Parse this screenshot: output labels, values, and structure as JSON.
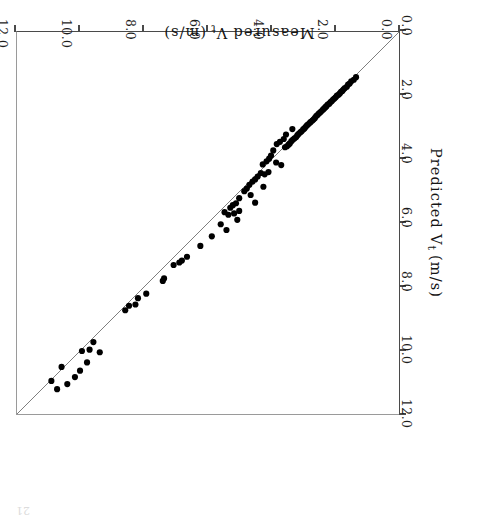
{
  "figure": {
    "rotation_degrees": 180,
    "background_color": "#ffffff",
    "frame_color": "#4a4a4a",
    "point_color": "#000000",
    "reference_line_color": "#707070",
    "page_artifact": "21"
  },
  "chart_data": {
    "type": "scatter",
    "title": "",
    "xlabel_parts": {
      "pre": "Measured",
      "symbol": "V",
      "subscript": "t",
      "units": "(m/s)"
    },
    "ylabel_parts": {
      "pre": "Predicted",
      "symbol": "V",
      "subscript": "t",
      "units": "(m/s)"
    },
    "xlabel": "Measured Vt (m/s)",
    "ylabel": "Predicted Vt (m/s)",
    "xlim": [
      0.0,
      12.0
    ],
    "ylim": [
      0.0,
      12.0
    ],
    "xticks": [
      0.0,
      2.0,
      4.0,
      6.0,
      8.0,
      10.0,
      12.0
    ],
    "yticks": [
      0.0,
      2.0,
      4.0,
      6.0,
      8.0,
      10.0,
      12.0
    ],
    "xticklabels": [
      "0.0",
      "2.0",
      "4.0",
      "6.0",
      "8.0",
      "10.0",
      "12.0"
    ],
    "yticklabels": [
      "0.0",
      "2.0",
      "4.0",
      "6.0",
      "8.0",
      "10.0",
      "12.0"
    ],
    "grid": false,
    "legend": null,
    "legend_position": "none",
    "marker": "filled-circle",
    "marker_size_px": 6.2,
    "reference_line": {
      "label": "1:1 line",
      "x": [
        0.0,
        12.0
      ],
      "y": [
        0.0,
        12.0
      ],
      "style": "solid",
      "width_px": 0.9
    },
    "points": [
      [
        1.35,
        1.42
      ],
      [
        1.42,
        1.5
      ],
      [
        1.5,
        1.55
      ],
      [
        1.55,
        1.62
      ],
      [
        1.6,
        1.65
      ],
      [
        1.64,
        1.72
      ],
      [
        1.7,
        1.76
      ],
      [
        1.74,
        1.8
      ],
      [
        1.78,
        1.85
      ],
      [
        1.82,
        1.88
      ],
      [
        1.86,
        1.93
      ],
      [
        1.9,
        1.97
      ],
      [
        1.95,
        2.0
      ],
      [
        1.99,
        2.05
      ],
      [
        2.03,
        2.09
      ],
      [
        2.07,
        2.12
      ],
      [
        2.11,
        2.17
      ],
      [
        2.15,
        2.2
      ],
      [
        2.19,
        2.25
      ],
      [
        2.24,
        2.28
      ],
      [
        2.28,
        2.33
      ],
      [
        2.31,
        2.36
      ],
      [
        2.35,
        2.4
      ],
      [
        2.39,
        2.44
      ],
      [
        2.44,
        2.49
      ],
      [
        2.48,
        2.53
      ],
      [
        2.52,
        2.56
      ],
      [
        2.56,
        2.61
      ],
      [
        2.6,
        2.64
      ],
      [
        2.64,
        2.7
      ],
      [
        2.68,
        2.74
      ],
      [
        2.72,
        2.78
      ],
      [
        2.77,
        2.82
      ],
      [
        2.8,
        2.85
      ],
      [
        2.85,
        2.9
      ],
      [
        2.89,
        2.93
      ],
      [
        2.93,
        2.98
      ],
      [
        2.97,
        3.03
      ],
      [
        3.01,
        3.06
      ],
      [
        3.06,
        3.12
      ],
      [
        3.1,
        3.15
      ],
      [
        3.15,
        3.2
      ],
      [
        3.19,
        3.24
      ],
      [
        3.23,
        3.3
      ],
      [
        3.28,
        3.34
      ],
      [
        3.33,
        3.38
      ],
      [
        3.38,
        3.43
      ],
      [
        3.43,
        3.5
      ],
      [
        3.47,
        3.54
      ],
      [
        3.52,
        3.59
      ],
      [
        3.58,
        3.62
      ],
      [
        3.35,
        3.05
      ],
      [
        3.55,
        3.22
      ],
      [
        3.62,
        3.36
      ],
      [
        3.74,
        3.45
      ],
      [
        3.84,
        3.52
      ],
      [
        3.95,
        3.72
      ],
      [
        4.02,
        3.88
      ],
      [
        4.08,
        3.98
      ],
      [
        3.7,
        4.18
      ],
      [
        3.86,
        4.1
      ],
      [
        4.16,
        4.06
      ],
      [
        4.28,
        4.16
      ],
      [
        4.1,
        4.4
      ],
      [
        4.22,
        4.47
      ],
      [
        4.34,
        4.43
      ],
      [
        4.44,
        4.54
      ],
      [
        4.52,
        4.63
      ],
      [
        4.6,
        4.7
      ],
      [
        4.26,
        4.86
      ],
      [
        4.7,
        4.8
      ],
      [
        4.78,
        4.92
      ],
      [
        4.66,
        5.12
      ],
      [
        4.86,
        5.0
      ],
      [
        4.52,
        5.36
      ],
      [
        5.02,
        5.22
      ],
      [
        5.12,
        5.38
      ],
      [
        5.22,
        5.44
      ],
      [
        5.3,
        5.52
      ],
      [
        5.02,
        5.62
      ],
      [
        5.18,
        5.7
      ],
      [
        5.36,
        5.74
      ],
      [
        5.08,
        5.9
      ],
      [
        5.48,
        5.66
      ],
      [
        5.6,
        6.04
      ],
      [
        5.42,
        6.22
      ],
      [
        5.88,
        6.42
      ],
      [
        6.24,
        6.72
      ],
      [
        6.66,
        7.06
      ],
      [
        6.82,
        7.18
      ],
      [
        6.9,
        7.24
      ],
      [
        7.08,
        7.32
      ],
      [
        7.38,
        7.74
      ],
      [
        7.42,
        7.82
      ],
      [
        7.94,
        8.22
      ],
      [
        8.2,
        8.36
      ],
      [
        8.28,
        8.56
      ],
      [
        8.48,
        8.6
      ],
      [
        8.6,
        8.74
      ],
      [
        9.4,
        10.06
      ],
      [
        9.6,
        9.74
      ],
      [
        9.72,
        9.98
      ],
      [
        9.8,
        10.38
      ],
      [
        9.96,
        10.02
      ],
      [
        10.02,
        10.64
      ],
      [
        10.18,
        10.84
      ],
      [
        10.42,
        11.06
      ],
      [
        10.6,
        10.52
      ],
      [
        10.74,
        11.22
      ],
      [
        10.92,
        10.96
      ]
    ]
  }
}
